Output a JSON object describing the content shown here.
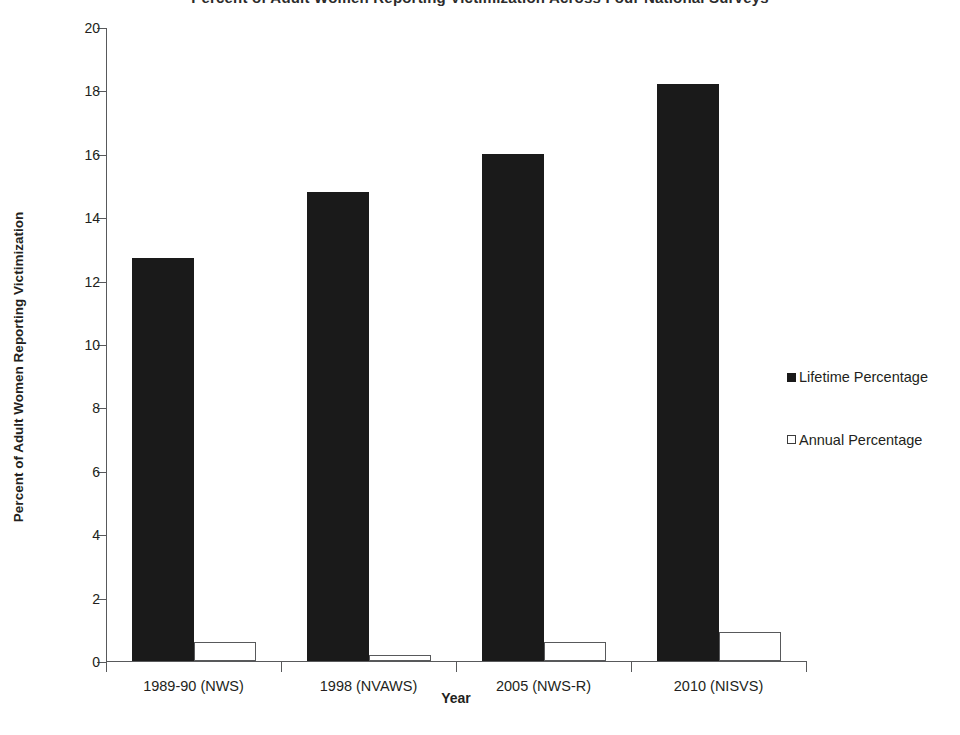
{
  "chart_data": {
    "type": "bar",
    "title": "Percent of Adult Women Reporting Victimization Across Four National Surveys",
    "xlabel": "Year",
    "ylabel": "Percent of Adult Women Reporting Victimization",
    "categories": [
      "1989-90 (NWS)",
      "1998 (NVAWS)",
      "2005 (NWS-R)",
      "2010 (NISVS)"
    ],
    "series": [
      {
        "name": "Lifetime Percentage",
        "values": [
          12.7,
          14.8,
          16.0,
          18.2
        ],
        "color": "#1a1a1a",
        "swatch": "filled"
      },
      {
        "name": "Annual Percentage",
        "values": [
          0.6,
          0.2,
          0.6,
          0.9
        ],
        "color": "#ffffff",
        "swatch": "open"
      }
    ],
    "ylim": [
      0,
      20
    ],
    "ytick_step": 2,
    "yticks": [
      20,
      18,
      16,
      14,
      12,
      10,
      8,
      6,
      4,
      2,
      0
    ],
    "grid": false,
    "legend_position": "right"
  }
}
